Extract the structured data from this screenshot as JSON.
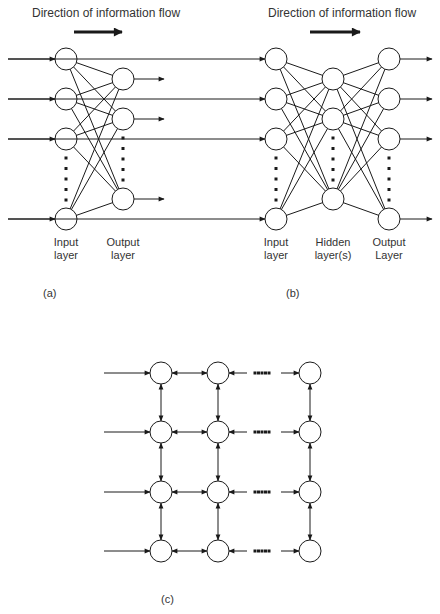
{
  "panel_a": {
    "title": "Direction of information flow",
    "caption": "(a)",
    "labels": {
      "input_line1": "Input",
      "input_line2": "layer",
      "output_line1": "Output",
      "output_line2": "layer"
    },
    "layers": [
      {
        "name": "input",
        "x": 66,
        "nodes_y": [
          59,
          99,
          139,
          219
        ]
      },
      {
        "name": "output",
        "x": 123,
        "nodes_y": [
          79,
          119,
          199
        ]
      }
    ]
  },
  "panel_b": {
    "title": "Direction of information flow",
    "caption": "(b)",
    "labels": {
      "input_line1": "Input",
      "input_line2": "layer",
      "hidden_line1": "Hidden",
      "hidden_line2": "layer(s)",
      "output_line1": "Output",
      "output_line2": "Layer"
    },
    "layers": [
      {
        "name": "input",
        "x": 276,
        "nodes_y": [
          59,
          99,
          139,
          219
        ]
      },
      {
        "name": "hidden",
        "x": 333,
        "nodes_y": [
          79,
          119,
          199
        ]
      },
      {
        "name": "output",
        "x": 389,
        "nodes_y": [
          59,
          99,
          139,
          219
        ]
      }
    ]
  },
  "panel_c": {
    "caption": "(c)",
    "grid": {
      "columns_x": [
        161,
        218,
        310
      ],
      "rows_y": [
        373,
        432,
        492,
        551
      ]
    }
  },
  "style": {
    "stroke": "#1a1a1a",
    "node_fill": "#ffffff",
    "node_radius": 11
  }
}
